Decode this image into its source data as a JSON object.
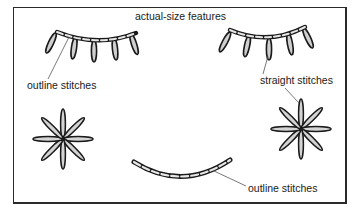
{
  "title": "actual-size features",
  "labels": {
    "outline_top": "outline stitches",
    "straight": "straight stitches",
    "outline_bottom": "outline stitches"
  },
  "elements": {
    "left_eye": "outline-stitch arc with 5 straight-stitch lashes",
    "right_eye": "outline-stitch arc with 5 straight-stitch lashes",
    "left_cheek": "8-point straight-stitch star",
    "right_cheek": "8-point straight-stitch star",
    "mouth": "outline-stitch smile arc"
  },
  "colors": {
    "stroke": "#1a1a1a",
    "fill": "#cfcfcf",
    "background": "#ffffff",
    "leader": "#555555"
  }
}
